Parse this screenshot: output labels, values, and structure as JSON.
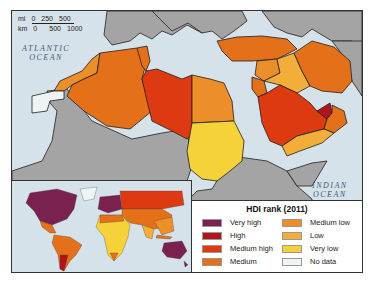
{
  "map": {
    "scale_bar": {
      "mi_label": "mi",
      "mi_ticks": [
        "0",
        "250",
        "500"
      ],
      "km_label": "km",
      "km_ticks": [
        "0",
        "500",
        "1000"
      ]
    },
    "labels": {
      "atlantic": [
        "ATLANTIC",
        "OCEAN"
      ],
      "indian": [
        "INDIAN",
        "OCEAN"
      ]
    },
    "colors": {
      "very_high": "#7b2150",
      "high": "#b3141c",
      "medium_high": "#dd3a12",
      "medium": "#e5701a",
      "medium_low": "#ec8e2a",
      "low": "#f2ae38",
      "very_low": "#f5d13a",
      "no_data": "#eef4f6",
      "other_land": "#a4a4a4",
      "water": "#d6e2ea"
    },
    "regions": [
      {
        "name": "Morocco",
        "rank": "Medium low"
      },
      {
        "name": "Western Sahara",
        "rank": "No data"
      },
      {
        "name": "Algeria",
        "rank": "Medium"
      },
      {
        "name": "Tunisia",
        "rank": "Medium"
      },
      {
        "name": "Libya",
        "rank": "Medium high"
      },
      {
        "name": "Egypt",
        "rank": "Medium low"
      },
      {
        "name": "Sudan",
        "rank": "Very low"
      },
      {
        "name": "Turkey",
        "rank": "Medium"
      },
      {
        "name": "Syria",
        "rank": "Medium low"
      },
      {
        "name": "Iraq",
        "rank": "Low"
      },
      {
        "name": "Iran",
        "rank": "Medium"
      },
      {
        "name": "Saudi Arabia",
        "rank": "Medium high"
      },
      {
        "name": "UAE",
        "rank": "High"
      },
      {
        "name": "Oman",
        "rank": "Medium"
      },
      {
        "name": "Yemen",
        "rank": "Low"
      },
      {
        "name": "Jordan",
        "rank": "Medium"
      }
    ]
  },
  "legend": {
    "title": "HDI rank (2011)",
    "items": [
      {
        "label": "Very high",
        "color": "#7b2150"
      },
      {
        "label": "High",
        "color": "#b3141c"
      },
      {
        "label": "Medium high",
        "color": "#dd3a12"
      },
      {
        "label": "Medium",
        "color": "#e5701a"
      },
      {
        "label": "Medium low",
        "color": "#ec8e2a"
      },
      {
        "label": "Low",
        "color": "#f2ae38"
      },
      {
        "label": "Very low",
        "color": "#f5d13a"
      },
      {
        "label": "No data",
        "color": "#eef4f6"
      }
    ]
  }
}
